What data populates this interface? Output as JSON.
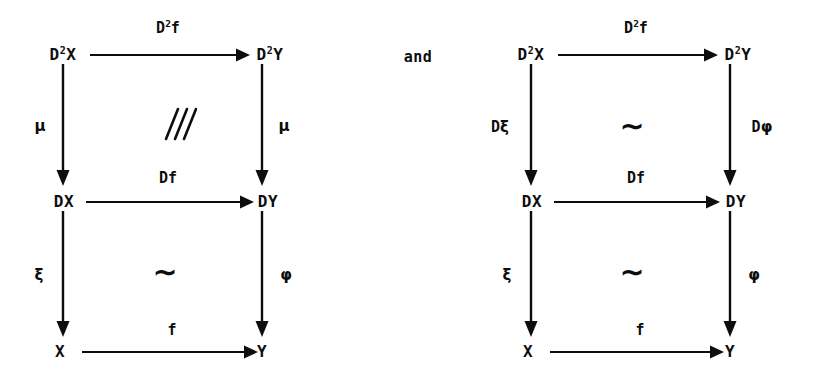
{
  "figure": {
    "kind": "commutative-diagram-pair",
    "conjunction": "and",
    "background_color": "#ffffff",
    "ink_color": "#0d0d0d"
  },
  "diagrams": [
    {
      "id": "left",
      "nodes": {
        "top_left": {
          "base": "D",
          "exponent": "2",
          "suffix": "X",
          "text": "D2X"
        },
        "top_right": {
          "base": "D",
          "exponent": "2",
          "suffix": "Y",
          "text": "D2Y"
        },
        "mid_left": {
          "text": "DX"
        },
        "mid_right": {
          "text": "DY"
        },
        "bottom_left": {
          "text": "X"
        },
        "bottom_right": {
          "text": "Y"
        }
      },
      "arrows": {
        "top": {
          "label_base": "D",
          "label_exponent": "2",
          "label_suffix": "f",
          "label": "D2f",
          "direction": "right"
        },
        "middle": {
          "label": "Df",
          "direction": "right"
        },
        "bottom": {
          "label": "f",
          "direction": "right"
        },
        "upper_left_vertical": {
          "label": "μ",
          "direction": "down"
        },
        "upper_right_vertical": {
          "label": "μ",
          "direction": "down"
        },
        "lower_left_vertical": {
          "label": "ξ",
          "direction": "down"
        },
        "lower_right_vertical": {
          "label": "φ",
          "direction": "down"
        }
      },
      "fills": {
        "upper_square": {
          "symbol": "slashes",
          "glyph": "///"
        },
        "lower_square": {
          "symbol": "tilde",
          "glyph": "∼"
        }
      }
    },
    {
      "id": "right",
      "nodes": {
        "top_left": {
          "base": "D",
          "exponent": "2",
          "suffix": "X",
          "text": "D2X"
        },
        "top_right": {
          "base": "D",
          "exponent": "2",
          "suffix": "Y",
          "text": "D2Y"
        },
        "mid_left": {
          "text": "DX"
        },
        "mid_right": {
          "text": "DY"
        },
        "bottom_left": {
          "text": "X"
        },
        "bottom_right": {
          "text": "Y"
        }
      },
      "arrows": {
        "top": {
          "label_base": "D",
          "label_exponent": "2",
          "label_suffix": "f",
          "label": "D2f",
          "direction": "right"
        },
        "middle": {
          "label": "Df",
          "direction": "right"
        },
        "bottom": {
          "label": "f",
          "direction": "right"
        },
        "upper_left_vertical": {
          "label_prefix": "D",
          "label_greek": "ξ",
          "label": "Dξ",
          "direction": "down"
        },
        "upper_right_vertical": {
          "label_prefix": "D",
          "label_greek": "φ",
          "label": "Dφ",
          "direction": "down"
        },
        "lower_left_vertical": {
          "label": "ξ",
          "direction": "down"
        },
        "lower_right_vertical": {
          "label": "φ",
          "direction": "down"
        }
      },
      "fills": {
        "upper_square": {
          "symbol": "tilde",
          "glyph": "∼"
        },
        "lower_square": {
          "symbol": "tilde",
          "glyph": "∼"
        }
      }
    }
  ]
}
